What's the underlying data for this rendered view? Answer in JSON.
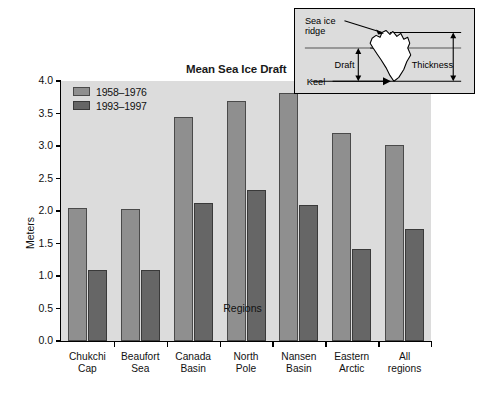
{
  "chart_data": {
    "type": "bar",
    "title": "Mean Sea Ice Draft",
    "xlabel": "Regions",
    "ylabel": "Meters",
    "ylim": [
      0.0,
      4.0
    ],
    "ytick_step": 0.5,
    "grid": false,
    "legend_position": "top-left inside plot",
    "categories": [
      "Chukchi Cap",
      "Beaufort Sea",
      "Canada Basin",
      "North Pole",
      "Nansen Basin",
      "Eastern Arctic",
      "All regions"
    ],
    "category_lines": [
      [
        "Chukchi",
        "Cap"
      ],
      [
        "Beaufort",
        "Sea"
      ],
      [
        "Canada",
        "Basin"
      ],
      [
        "North",
        "Pole"
      ],
      [
        "Nansen",
        "Basin"
      ],
      [
        "Eastern",
        "Arctic"
      ],
      [
        "All",
        "regions"
      ]
    ],
    "yticks": [
      "0.0",
      "0.5",
      "1.0",
      "1.5",
      "2.0",
      "2.5",
      "3.0",
      "3.5",
      "4.0"
    ],
    "ytick_values": [
      0.0,
      0.5,
      1.0,
      1.5,
      2.0,
      2.5,
      3.0,
      3.5,
      4.0
    ],
    "series": [
      {
        "name": "1958–1976",
        "color": "#8f8f8f",
        "values": [
          2.04,
          2.03,
          3.45,
          3.7,
          3.82,
          3.2,
          3.02
        ]
      },
      {
        "name": "1993–1997",
        "color": "#666666",
        "values": [
          1.1,
          1.1,
          2.13,
          2.32,
          2.1,
          1.42,
          1.73
        ]
      }
    ]
  },
  "inset": {
    "labels": {
      "sea_ice_ridge_line1": "Sea ice",
      "sea_ice_ridge_line2": "ridge",
      "draft": "Draft",
      "thickness": "Thickness",
      "keel": "Keel"
    }
  },
  "colors": {
    "plot_background": "#dcdcdc",
    "series_1958_1976": "#8f8f8f",
    "series_1993_1997": "#666666",
    "axis": "#000000",
    "text": "#111111"
  }
}
